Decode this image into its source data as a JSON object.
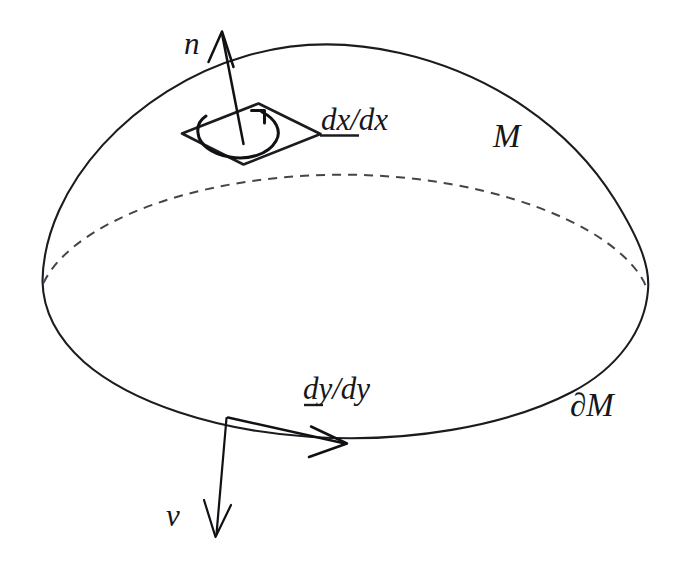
{
  "figure": {
    "background_color": "#ffffff",
    "ink_color": "#17171b",
    "hidden_edge_color": "#44444c",
    "width": 695,
    "height": 574
  },
  "labels": {
    "normal_vector": "n",
    "surface_element": {
      "prefix": "d",
      "rest": "x/dx",
      "full": "dx/dx"
    },
    "boundary_element": {
      "prefix": "d",
      "rest": "y/dy",
      "full": "dy/dy"
    },
    "manifold": "M",
    "boundary": "∂M",
    "outward_normal": "ν"
  },
  "annotations": {
    "orientation_arrow": "counterclockwise-curl",
    "normal_arrow_direction": "up",
    "outward_normal_direction": "down",
    "tangent_arrow_direction": "right"
  }
}
